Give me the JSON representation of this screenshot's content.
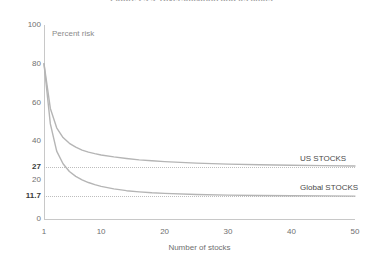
{
  "figure": {
    "title": "Figure 2.2.2  Diversification and its limits",
    "title_clipped": true
  },
  "annotations": {
    "percent_risk": "Percent risk"
  },
  "axes": {
    "y": {
      "label": "",
      "min": 0,
      "max": 100,
      "ticks": [
        {
          "value": 100,
          "text": "100",
          "bold": false
        },
        {
          "value": 80,
          "text": "80",
          "bold": false
        },
        {
          "value": 60,
          "text": "60",
          "bold": false
        },
        {
          "value": 40,
          "text": "40",
          "bold": false
        },
        {
          "value": 27,
          "text": "27",
          "bold": true
        },
        {
          "value": 20,
          "text": "20",
          "bold": false
        },
        {
          "value": 11.7,
          "text": "11.7",
          "bold": true
        },
        {
          "value": 0,
          "text": "0",
          "bold": false
        }
      ]
    },
    "x": {
      "label": "Number of stocks",
      "min": 1,
      "max": 50,
      "ticks": [
        {
          "value": 1,
          "text": "1"
        },
        {
          "value": 10,
          "text": "10"
        },
        {
          "value": 20,
          "text": "20"
        },
        {
          "value": 30,
          "text": "30"
        },
        {
          "value": 40,
          "text": "40"
        },
        {
          "value": 50,
          "text": "50"
        }
      ]
    }
  },
  "gridlines": [
    {
      "value": 27,
      "style": "dotted",
      "color": "#bdbdbd"
    },
    {
      "value": 11.7,
      "style": "dotted",
      "color": "#bdbdbd"
    }
  ],
  "series_labels": [
    {
      "text": "US STOCKS",
      "value": 27
    },
    {
      "text": "Global STOCKS",
      "value": 11.7
    }
  ],
  "colors": {
    "curve": "#b5b5b5",
    "axis": "#c8c8c8",
    "grid": "#bdbdbd",
    "text": "#6f6f6f",
    "text_bold": "#3a3a3a",
    "background": "#ffffff"
  },
  "chart_data": {
    "type": "line",
    "title": "Figure 2.2.2  Diversification and its limits",
    "xlabel": "Number of stocks",
    "ylabel": "Percent risk",
    "xlim": [
      1,
      50
    ],
    "ylim": [
      0,
      100
    ],
    "grid": true,
    "legend_position": "right-inline",
    "asymptotes": [
      {
        "name": "US STOCKS",
        "value": 27
      },
      {
        "name": "Global STOCKS",
        "value": 11.7
      }
    ],
    "x": [
      1,
      2,
      3,
      4,
      5,
      6,
      7,
      8,
      9,
      10,
      12,
      14,
      16,
      18,
      20,
      25,
      30,
      35,
      40,
      45,
      50
    ],
    "series": [
      {
        "name": "US STOCKS",
        "color": "#b5b5b5",
        "values": [
          80,
          57,
          47,
          42,
          39,
          37,
          35.5,
          34.5,
          33.7,
          33,
          32,
          31.2,
          30.5,
          30,
          29.6,
          28.8,
          28.3,
          28,
          27.7,
          27.5,
          27.3
        ]
      },
      {
        "name": "Global STOCKS",
        "color": "#b5b5b5",
        "values": [
          80,
          49,
          35,
          28.5,
          24.5,
          22,
          20.2,
          18.8,
          17.7,
          16.8,
          15.5,
          14.6,
          14,
          13.5,
          13.2,
          12.6,
          12.3,
          12.1,
          12.0,
          11.9,
          11.8
        ]
      }
    ]
  }
}
